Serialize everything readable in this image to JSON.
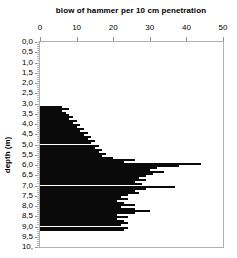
{
  "title": "blow of hammer per 10 cm penetration",
  "x_axis": {
    "ticks": [
      "0",
      "10",
      "20",
      "30",
      "40",
      "50"
    ],
    "tick_values": [
      0,
      10,
      20,
      30,
      40,
      50
    ]
  },
  "y_axis": {
    "label": "depth (m)",
    "tick_labels": [
      "0,0",
      "0,5",
      "1,0",
      "1,5",
      "2,0",
      "2,5",
      "3,0",
      "3,5",
      "4,0",
      "4,5",
      "5,0",
      "5,5",
      "6,0",
      "6,5",
      "7,0",
      "7,5",
      "8,0",
      "8,5",
      "9,0",
      "9,5",
      "10,"
    ],
    "tick_step": 0.5,
    "minor_tick_step": 0.1
  },
  "colors": {
    "bar": "#0a0a0a",
    "frame": "#b0b0b0",
    "major_tick": "#8c8c8c",
    "minor_tick": "#b5b5b5",
    "text": "#000000",
    "background": "#ffffff"
  },
  "chart_data": {
    "type": "bar",
    "orientation": "horizontal",
    "title": "blow of hammer per 10 cm penetration",
    "xlabel": "blow of hammer per 10 cm penetration",
    "ylabel": "depth (m)",
    "xlim": [
      0,
      50
    ],
    "ylim": [
      0,
      10
    ],
    "grid": false,
    "legend": false,
    "bar_thickness_m": 0.1,
    "depths": [
      3.1,
      3.2,
      3.3,
      3.4,
      3.5,
      3.6,
      3.7,
      3.8,
      3.9,
      4.0,
      4.1,
      4.2,
      4.3,
      4.4,
      4.5,
      4.6,
      4.7,
      4.8,
      4.9,
      5.0,
      5.1,
      5.2,
      5.3,
      5.4,
      5.5,
      5.6,
      5.7,
      5.8,
      5.9,
      6.0,
      6.1,
      6.2,
      6.3,
      6.4,
      6.5,
      6.6,
      6.7,
      6.8,
      6.9,
      7.0,
      7.1,
      7.2,
      7.3,
      7.4,
      7.5,
      7.6,
      7.7,
      7.8,
      7.9,
      8.0,
      8.1,
      8.2,
      8.3,
      8.4,
      8.5,
      8.6,
      8.7,
      8.8,
      8.9,
      9.0,
      9.1
    ],
    "values": [
      6,
      8,
      6,
      7,
      8,
      9,
      8,
      10,
      9,
      11,
      10,
      12,
      11,
      13,
      12,
      14,
      13,
      15,
      14,
      16,
      15,
      17,
      16,
      18,
      17,
      20,
      26,
      23,
      44,
      38,
      32,
      30,
      34,
      31,
      29,
      27,
      29,
      26,
      28,
      37,
      29,
      26,
      27,
      24,
      22,
      24,
      21,
      23,
      26,
      22,
      26,
      30,
      26,
      21,
      24,
      21,
      23,
      24,
      22,
      24,
      23
    ]
  }
}
